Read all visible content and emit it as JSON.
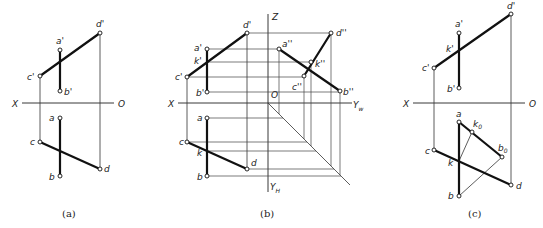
{
  "figures": [
    {
      "id": "a",
      "caption": "(a)",
      "axis": {
        "left": "X",
        "right": "O"
      },
      "points": {
        "a_front": "a'",
        "b_front": "b'",
        "c_front": "c'",
        "d_front": "d'",
        "a_top": "a",
        "b_top": "b",
        "c_top": "c",
        "d_top": "d"
      }
    },
    {
      "id": "b",
      "caption": "(b)",
      "axis": {
        "left": "X",
        "origin": "O",
        "up": "Z",
        "right": "Y",
        "right_sub": "w",
        "down": "Y",
        "down_sub": "H"
      },
      "points": {
        "a_front": "a'",
        "b_front": "b'",
        "c_front": "c'",
        "d_front": "d'",
        "k_front": "k'",
        "a_side": "a''",
        "b_side": "b''",
        "c_side": "c''",
        "d_side": "d''",
        "k_side": "k''",
        "a_top": "a",
        "b_top": "b",
        "c_top": "c",
        "d_top": "d",
        "k_top": "k"
      }
    },
    {
      "id": "c",
      "caption": "(c)",
      "axis": {
        "left": "X",
        "right": "O"
      },
      "points": {
        "a_front": "a'",
        "b_front": "b'",
        "c_front": "c'",
        "d_front": "d'",
        "k_front": "k'",
        "a_top": "a",
        "b_top": "b",
        "c_top": "c",
        "d_top": "d",
        "k_top": "k",
        "k0": "k",
        "k0_sub": "0",
        "b0": "b",
        "b0_sub": "0"
      }
    }
  ]
}
